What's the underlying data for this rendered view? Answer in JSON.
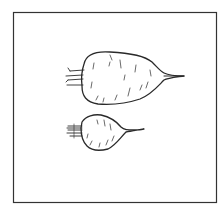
{
  "figure": {
    "items": [
      {
        "name": "large-root",
        "size": "large",
        "shape": "elongated tapered"
      },
      {
        "name": "small-root",
        "size": "small",
        "shape": "round"
      }
    ],
    "colors": {
      "ink": "#2a2a2a",
      "background": "#ffffff"
    }
  }
}
